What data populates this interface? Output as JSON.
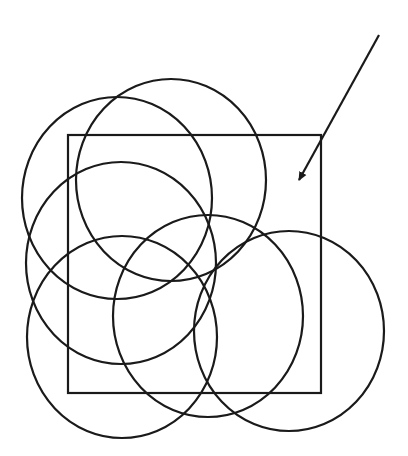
{
  "diagram": {
    "background": "#ffffff",
    "stroke_color": "#1a1a1a",
    "stroke_width": 2.2,
    "rectangle": {
      "x": 68,
      "y": 135,
      "width": 253,
      "height": 258
    },
    "circles": [
      {
        "id": "circle-upper-left",
        "cx": 117,
        "cy": 198,
        "rx": 95,
        "ry": 101
      },
      {
        "id": "circle-top-center",
        "cx": 171,
        "cy": 180,
        "rx": 95,
        "ry": 101
      },
      {
        "id": "circle-middle-left",
        "cx": 121,
        "cy": 263,
        "rx": 95,
        "ry": 101
      },
      {
        "id": "circle-bottom-left",
        "cx": 122,
        "cy": 337,
        "rx": 95,
        "ry": 101
      },
      {
        "id": "circle-bottom-center",
        "cx": 208,
        "cy": 316,
        "rx": 95,
        "ry": 101
      },
      {
        "id": "circle-bottom-right",
        "cx": 289,
        "cy": 331,
        "rx": 95,
        "ry": 100
      }
    ],
    "arrow": {
      "x1": 379,
      "y1": 35,
      "x2": 299,
      "y2": 180
    }
  }
}
